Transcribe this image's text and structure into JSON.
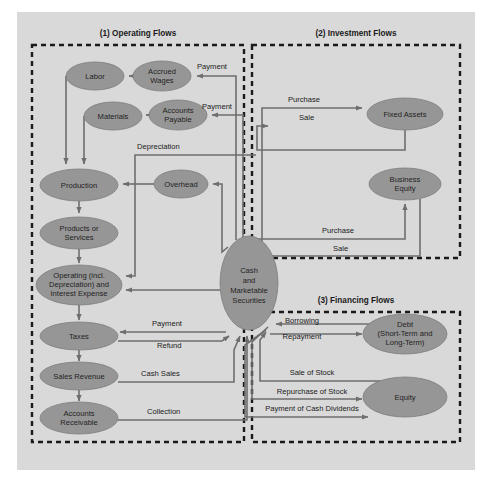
{
  "figure": {
    "background_color": "#d9d9d9",
    "frame_color": "#ffffff",
    "node_fill": "#969696",
    "line_color": "#6e6e6e",
    "dash_color": "#1a1a1a"
  },
  "sections": [
    {
      "id": "operating",
      "title": "(1) Operating Flows",
      "x": 32,
      "y": 45,
      "w": 212,
      "h": 397,
      "title_x": 138,
      "title_y": 36
    },
    {
      "id": "investment",
      "title": "(2) Investment Flows",
      "x": 252,
      "y": 45,
      "w": 208,
      "h": 213,
      "title_x": 356,
      "title_y": 36
    },
    {
      "id": "financing",
      "title": "(3) Financing Flows",
      "x": 252,
      "y": 312,
      "w": 208,
      "h": 130,
      "title_x": 356,
      "title_y": 303
    }
  ],
  "nodes": [
    {
      "id": "labor",
      "lines": [
        "Labor"
      ],
      "cx": 95,
      "cy": 76,
      "rx": 29,
      "ry": 14
    },
    {
      "id": "accrued-wages",
      "lines": [
        "Accrued",
        "Wages"
      ],
      "cx": 162,
      "cy": 76,
      "rx": 29,
      "ry": 15
    },
    {
      "id": "materials",
      "lines": [
        "Materials"
      ],
      "cx": 113,
      "cy": 116,
      "rx": 29,
      "ry": 14
    },
    {
      "id": "accounts-payable",
      "lines": [
        "Accounts",
        "Payable"
      ],
      "cx": 178,
      "cy": 115,
      "rx": 29,
      "ry": 15
    },
    {
      "id": "production",
      "lines": [
        "Production"
      ],
      "cx": 79,
      "cy": 185,
      "rx": 39,
      "ry": 16
    },
    {
      "id": "overhead",
      "lines": [
        "Overhead"
      ],
      "cx": 181,
      "cy": 184,
      "rx": 27,
      "ry": 14
    },
    {
      "id": "products-services",
      "lines": [
        "Products or",
        "Services"
      ],
      "cx": 79,
      "cy": 233,
      "rx": 39,
      "ry": 16
    },
    {
      "id": "operating-expense",
      "lines": [
        "Operating (incl.",
        "Depreciation) and",
        "Interest Expense"
      ],
      "cx": 79,
      "cy": 285,
      "rx": 43,
      "ry": 20
    },
    {
      "id": "taxes",
      "lines": [
        "Taxes"
      ],
      "cx": 79,
      "cy": 336,
      "rx": 39,
      "ry": 14
    },
    {
      "id": "sales-revenue",
      "lines": [
        "Sales Revenue"
      ],
      "cx": 79,
      "cy": 376,
      "rx": 39,
      "ry": 14
    },
    {
      "id": "accounts-receivable",
      "lines": [
        "Accounts",
        "Receivable"
      ],
      "cx": 79,
      "cy": 418,
      "rx": 39,
      "ry": 16
    },
    {
      "id": "cash",
      "lines": [
        "Cash",
        "and",
        "Marketable",
        "Securities"
      ],
      "cx": 249,
      "cy": 283,
      "rx": 29,
      "ry": 47
    },
    {
      "id": "fixed-assets",
      "lines": [
        "Fixed Assets"
      ],
      "cx": 405,
      "cy": 114,
      "rx": 38,
      "ry": 16
    },
    {
      "id": "business-equity",
      "lines": [
        "Business",
        "Equity"
      ],
      "cx": 405,
      "cy": 184,
      "rx": 36,
      "ry": 16
    },
    {
      "id": "debt",
      "lines": [
        "Debt",
        "(Short-Term and",
        "Long-Term)"
      ],
      "cx": 405,
      "cy": 334,
      "rx": 42,
      "ry": 20
    },
    {
      "id": "equity",
      "lines": [
        "Equity"
      ],
      "cx": 405,
      "cy": 397,
      "rx": 42,
      "ry": 20
    }
  ],
  "edge_labels": [
    {
      "id": "payment-wages",
      "text": "Payment",
      "x": 197,
      "y": 69,
      "anchor": "start"
    },
    {
      "id": "payment-ap",
      "text": "Payment",
      "x": 202,
      "y": 109,
      "anchor": "start"
    },
    {
      "id": "depreciation",
      "text": "Depreciation",
      "x": 137,
      "y": 149,
      "anchor": "start"
    },
    {
      "id": "purchase-fixed",
      "text": "Purchase",
      "x": 288,
      "y": 102,
      "anchor": "start"
    },
    {
      "id": "sale-fixed",
      "text": "Sale",
      "x": 299,
      "y": 120,
      "anchor": "start"
    },
    {
      "id": "purchase-business",
      "text": "Purchase",
      "x": 322,
      "y": 233,
      "anchor": "start"
    },
    {
      "id": "sale-business",
      "text": "Sale",
      "x": 333,
      "y": 251,
      "anchor": "start"
    },
    {
      "id": "payment-taxes",
      "text": "Payment",
      "x": 152,
      "y": 326,
      "anchor": "start"
    },
    {
      "id": "refund-taxes",
      "text": "Refund",
      "x": 157,
      "y": 348,
      "anchor": "start"
    },
    {
      "id": "cash-sales",
      "text": "Cash Sales",
      "x": 141,
      "y": 376,
      "anchor": "start"
    },
    {
      "id": "collection",
      "text": "Collection",
      "x": 147,
      "y": 414,
      "anchor": "start"
    },
    {
      "id": "borrowing",
      "text": "Borrowing",
      "x": 302,
      "y": 323,
      "anchor": "middle"
    },
    {
      "id": "repayment",
      "text": "Repayment",
      "x": 302,
      "y": 339,
      "anchor": "middle"
    },
    {
      "id": "sale-of-stock",
      "text": "Sale of Stock",
      "x": 312,
      "y": 375,
      "anchor": "middle"
    },
    {
      "id": "repurchase-of-stock",
      "text": "Repurchase of Stock",
      "x": 312,
      "y": 394,
      "anchor": "middle"
    },
    {
      "id": "payment-of-dividends",
      "text": "Payment of Cash Dividends",
      "x": 312,
      "y": 411,
      "anchor": "middle"
    }
  ]
}
